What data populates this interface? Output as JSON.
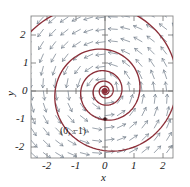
{
  "figure": {
    "type": "phase-portrait",
    "background": "#ffffff"
  },
  "axes": {
    "xlabel": "x",
    "ylabel": "y",
    "xticks": [
      "-2",
      "-1",
      "0",
      "1",
      "2"
    ],
    "yticks": [
      "2",
      "1",
      "0",
      "-1",
      "-2"
    ],
    "xlim": [
      -2.55,
      2.55
    ],
    "ylim": [
      -2.55,
      2.55
    ],
    "frame_color": "#808080",
    "axis_color": "#555555",
    "grid": false
  },
  "annotations": [
    {
      "text": "(0, −1)",
      "x": 0.02,
      "y": -1.12
    }
  ],
  "chart_data": {
    "type": "line",
    "title": "",
    "xlabel": "x",
    "ylabel": "y",
    "xlim": [
      -2.55,
      2.55
    ],
    "ylim": [
      -2.55,
      2.55
    ],
    "grid": false,
    "legend": "none",
    "series": [
      {
        "name": "spiral-trajectory",
        "color": "#8c2f39",
        "description": "stable spiral sink trajectory from (0,-1) winding inward to origin and outward to boundary",
        "start_point": [
          0,
          -1
        ],
        "equilibrium": [
          0,
          0
        ]
      },
      {
        "name": "direction-field",
        "color": "#7a8490",
        "description": "grid of unit arrows showing rotational flow",
        "arrow_grid_step": 0.425
      }
    ],
    "markers": [
      {
        "label": "origin-equilibrium",
        "x": 0,
        "y": 0,
        "color": "#8c2f39"
      },
      {
        "label": "initial-condition",
        "x": 0,
        "y": -1,
        "color": "#3a1418"
      }
    ]
  }
}
